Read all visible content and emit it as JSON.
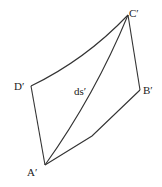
{
  "diagram": {
    "type": "deformed-element",
    "vertices": [
      {
        "id": "A",
        "label": "A′",
        "x": 45,
        "y": 165
      },
      {
        "id": "B",
        "label": "B′",
        "x": 140,
        "y": 90
      },
      {
        "id": "C",
        "label": "C′",
        "x": 128,
        "y": 15
      },
      {
        "id": "D",
        "label": "D′",
        "x": 31,
        "y": 86
      }
    ],
    "diagonal_label": "ds′",
    "colors": {
      "line": "#333333",
      "text": "#222222",
      "background": "#ffffff"
    }
  }
}
